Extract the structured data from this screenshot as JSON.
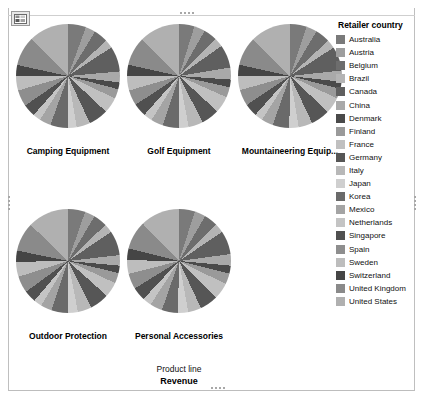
{
  "viz": {
    "type_icon": "chart-table-icon",
    "background": "#ffffff",
    "border_color": "#bfbfbf"
  },
  "legend": {
    "title": "Retailer country",
    "items": [
      {
        "label": "Australia",
        "color": "#7a7a7a"
      },
      {
        "label": "Austria",
        "color": "#9e9e9e"
      },
      {
        "label": "Belgium",
        "color": "#6d6d6d"
      },
      {
        "label": "Brazil",
        "color": "#b4b4b4"
      },
      {
        "label": "Canada",
        "color": "#5f5f5f"
      },
      {
        "label": "China",
        "color": "#a9a9a9"
      },
      {
        "label": "Denmark",
        "color": "#4a4a4a"
      },
      {
        "label": "Finland",
        "color": "#9a9a9a"
      },
      {
        "label": "France",
        "color": "#c0c0c0"
      },
      {
        "label": "Germany",
        "color": "#565656"
      },
      {
        "label": "Italy",
        "color": "#b8b8b8"
      },
      {
        "label": "Japan",
        "color": "#cfcfcf"
      },
      {
        "label": "Korea",
        "color": "#6a6a6a"
      },
      {
        "label": "Mexico",
        "color": "#a4a4a4"
      },
      {
        "label": "Netherlands",
        "color": "#c4c4c4"
      },
      {
        "label": "Singapore",
        "color": "#505050"
      },
      {
        "label": "Spain",
        "color": "#8e8e8e"
      },
      {
        "label": "Sweden",
        "color": "#bdbdbd"
      },
      {
        "label": "Switzerland",
        "color": "#454545"
      },
      {
        "label": "United Kingdom",
        "color": "#8a8a8a"
      },
      {
        "label": "United States",
        "color": "#b0b0b0"
      }
    ]
  },
  "axis_captions": {
    "product_line": "Product line",
    "revenue": "Revenue"
  },
  "chart_data": {
    "type": "pie",
    "title": "",
    "xlabel": "Product line",
    "ylabel": "Revenue",
    "legend_title": "Retailer country",
    "legend_position": "right",
    "grid": false,
    "categories": [
      "Australia",
      "Austria",
      "Belgium",
      "Brazil",
      "Canada",
      "China",
      "Denmark",
      "Finland",
      "France",
      "Germany",
      "Italy",
      "Japan",
      "Korea",
      "Mexico",
      "Netherlands",
      "Singapore",
      "Spain",
      "Sweden",
      "Switzerland",
      "United Kingdom",
      "United States"
    ],
    "colors": [
      "#7a7a7a",
      "#9e9e9e",
      "#6d6d6d",
      "#b4b4b4",
      "#5f5f5f",
      "#a9a9a9",
      "#4a4a4a",
      "#9a9a9a",
      "#c0c0c0",
      "#565656",
      "#b8b8b8",
      "#cfcfcf",
      "#6a6a6a",
      "#a4a4a4",
      "#c4c4c4",
      "#505050",
      "#8e8e8e",
      "#bdbdbd",
      "#454545",
      "#8a8a8a",
      "#b0b0b0"
    ],
    "panels": [
      {
        "label": "Camping Equipment",
        "label_truncated": false,
        "values": [
          5.6,
          3.1,
          4.4,
          2.6,
          7.9,
          3.4,
          2.1,
          3.0,
          4.9,
          6.1,
          4.2,
          2.8,
          5.4,
          3.6,
          2.4,
          3.9,
          5.1,
          4.6,
          3.3,
          9.2,
          12.4
        ]
      },
      {
        "label": "Golf Equipment",
        "label_truncated": false,
        "values": [
          4.8,
          3.4,
          4.1,
          2.9,
          7.2,
          3.7,
          2.4,
          3.2,
          5.2,
          5.6,
          4.5,
          3.1,
          5.0,
          3.8,
          2.7,
          4.1,
          4.8,
          4.4,
          3.6,
          8.8,
          12.7
        ]
      },
      {
        "label": "Mountaineering Equip...",
        "label_truncated": true,
        "values": [
          5.2,
          3.3,
          4.6,
          2.7,
          7.5,
          3.5,
          2.2,
          3.1,
          5.0,
          5.9,
          4.3,
          2.9,
          5.2,
          3.7,
          2.5,
          4.0,
          5.0,
          4.5,
          3.4,
          9.0,
          12.5
        ]
      },
      {
        "label": "Outdoor Protection",
        "label_truncated": false,
        "values": [
          5.4,
          3.2,
          4.3,
          2.8,
          7.7,
          3.3,
          2.3,
          3.3,
          4.7,
          6.0,
          4.4,
          3.0,
          5.3,
          3.5,
          2.6,
          3.8,
          5.2,
          4.7,
          3.5,
          9.1,
          12.9
        ]
      },
      {
        "label": "Personal Accessories",
        "label_truncated": false,
        "values": [
          5.0,
          3.5,
          4.2,
          3.0,
          7.4,
          3.6,
          2.5,
          3.4,
          5.1,
          5.8,
          4.1,
          3.2,
          5.1,
          3.9,
          2.8,
          4.2,
          4.9,
          4.3,
          3.7,
          8.9,
          12.4
        ]
      }
    ]
  }
}
